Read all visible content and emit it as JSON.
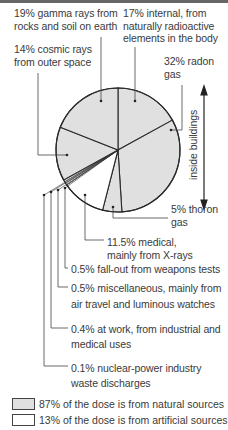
{
  "chart_data": {
    "type": "pie",
    "title": "",
    "start_angle_deg": 0,
    "direction": "clockwise",
    "slices": [
      {
        "label": "17% internal, from naturally radioactive elements in the body",
        "value": 17,
        "category": "natural"
      },
      {
        "label": "32% radon gas",
        "value": 32,
        "category": "natural"
      },
      {
        "label": "5% thoron gas",
        "value": 5,
        "category": "natural"
      },
      {
        "label": "11.5% medical, mainly from X-rays",
        "value": 11.5,
        "category": "artificial"
      },
      {
        "label": "0.5% fall-out from weapons tests",
        "value": 0.5,
        "category": "artificial"
      },
      {
        "label": "0.5% miscellaneous, mainly from air travel and luminous watches",
        "value": 0.5,
        "category": "artificial"
      },
      {
        "label": "0.4% at work, from industrial and medical uses",
        "value": 0.4,
        "category": "artificial"
      },
      {
        "label": "0.1% nuclear-power industry waste discharges",
        "value": 0.1,
        "category": "artificial"
      },
      {
        "label": "14% cosmic rays from outer space",
        "value": 14,
        "category": "natural"
      },
      {
        "label": "19% gamma rays from rocks and soil on earth",
        "value": 19,
        "category": "natural"
      }
    ],
    "annotation": "inside buildings",
    "legend": [
      {
        "label": "87% of the dose is from natural sources",
        "value": 87,
        "color": "#e0e0e0"
      },
      {
        "label": "13% of the dose is from artificial sources",
        "value": 13,
        "color": "#ffffff"
      }
    ],
    "legend_position": "bottom"
  },
  "labels": {
    "gamma": [
      "19% gamma rays from",
      "rocks and soil on earth"
    ],
    "internal": [
      "17% internal, from",
      "naturally radioactive",
      "elements in the body"
    ],
    "cosmic": [
      "14% cosmic rays",
      "from outer space"
    ],
    "radon": [
      "32% radon",
      "gas"
    ],
    "inside": "inside buildings",
    "thoron": [
      "5% thoron",
      "gas"
    ],
    "medical": [
      "11.5% medical,",
      "mainly from X-rays"
    ],
    "fallout": [
      "0.5% fall-out from weapons tests"
    ],
    "misc": [
      "0.5% miscellaneous, mainly from",
      "air travel and luminous watches"
    ],
    "work": [
      "0.4% at work, from industrial and",
      "medical uses"
    ],
    "nuclear": [
      "0.1% nuclear-power industry",
      "waste discharges"
    ]
  },
  "legend": {
    "natural": "87% of the dose is from natural sources",
    "artificial": "13% of the dose is from artificial sources"
  },
  "colors": {
    "natural_fill": "#e0e0e0",
    "artificial_fill": "#ffffff",
    "line": "#2a2a2a"
  }
}
